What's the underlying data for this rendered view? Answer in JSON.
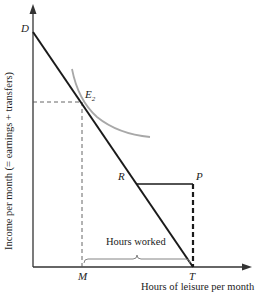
{
  "diagram": {
    "type": "labor-leisure budget constraint",
    "y_axis_label": "Income per month (= earnings + transfers)",
    "x_axis_label": "Hours of leisure per month",
    "points": {
      "D": "D",
      "E2": "E",
      "E2_sub": "2",
      "R": "R",
      "P": "P",
      "M": "M",
      "T": "T"
    },
    "annotation": "Hours worked",
    "colors": {
      "budget_line": "#1a1a1a",
      "indifference_curve": "#a8a8a8",
      "axes": "#333333"
    }
  }
}
